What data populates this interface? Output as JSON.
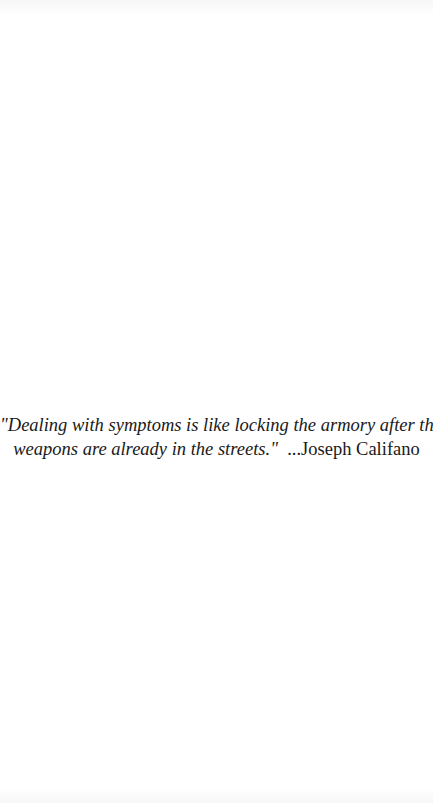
{
  "document": {
    "quote": {
      "line1": "\"Dealing with symptoms is like locking the armory after the",
      "line2": "weapons are already in the streets.\"",
      "attribution": "...Joseph Califano"
    },
    "colors": {
      "background": "#ffffff",
      "text": "#1a1a1a"
    }
  }
}
